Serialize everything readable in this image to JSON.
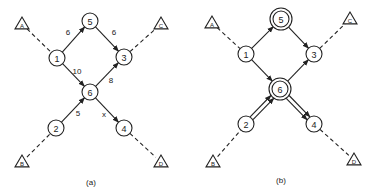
{
  "panels": [
    {
      "caption": "(a)",
      "terminals": [
        {
          "id": "A",
          "label": "A",
          "x": 22,
          "y": 24
        },
        {
          "id": "C",
          "label": "C",
          "x": 161,
          "y": 24
        },
        {
          "id": "B",
          "label": "B",
          "x": 22,
          "y": 162
        },
        {
          "id": "D",
          "label": "D",
          "x": 161,
          "y": 162
        }
      ],
      "nodes": [
        {
          "id": "1",
          "label": "1",
          "x": 57,
          "y": 58
        },
        {
          "id": "5",
          "label": "5",
          "x": 90,
          "y": 21
        },
        {
          "id": "3",
          "label": "3",
          "x": 124,
          "y": 57
        },
        {
          "id": "6",
          "label": "6",
          "x": 90,
          "y": 92
        },
        {
          "id": "2",
          "label": "2",
          "x": 56,
          "y": 128
        },
        {
          "id": "4",
          "label": "4",
          "x": 124,
          "y": 128
        }
      ],
      "edges": [
        {
          "from": "1",
          "to": "5",
          "weight": "6",
          "wx": 68,
          "wy": 32
        },
        {
          "from": "5",
          "to": "3",
          "weight": "6",
          "wx": 114,
          "wy": 32
        },
        {
          "from": "1",
          "to": "6",
          "weight": "10",
          "wx": 77,
          "wy": 71
        },
        {
          "from": "6",
          "to": "3",
          "weight": "8",
          "wx": 111,
          "wy": 80
        },
        {
          "from": "2",
          "to": "6",
          "weight": "5",
          "wx": 78,
          "wy": 113
        },
        {
          "from": "6",
          "to": "4",
          "weight": "x",
          "wx": 104,
          "wy": 114
        }
      ],
      "dashed": [
        {
          "from": "A",
          "to": "1"
        },
        {
          "from": "3",
          "to": "C"
        },
        {
          "from": "B",
          "to": "2"
        },
        {
          "from": "4",
          "to": "D"
        }
      ]
    },
    {
      "caption": "(b)",
      "terminals": [
        {
          "id": "A",
          "label": "A",
          "x": 212,
          "y": 23
        },
        {
          "id": "C",
          "label": "C",
          "x": 350,
          "y": 19
        },
        {
          "id": "B",
          "label": "B",
          "x": 213,
          "y": 162
        },
        {
          "id": "D",
          "label": "D",
          "x": 354,
          "y": 160
        }
      ],
      "nodes": [
        {
          "id": "1",
          "label": "1",
          "x": 246,
          "y": 54
        },
        {
          "id": "5",
          "label": "5",
          "x": 281,
          "y": 19,
          "double": true
        },
        {
          "id": "3",
          "label": "3",
          "x": 314,
          "y": 54
        },
        {
          "id": "6",
          "label": "6",
          "x": 280,
          "y": 89,
          "double": true
        },
        {
          "id": "2",
          "label": "2",
          "x": 246,
          "y": 124
        },
        {
          "id": "4",
          "label": "4",
          "x": 314,
          "y": 124
        }
      ],
      "edges": [
        {
          "from": "1",
          "to": "5"
        },
        {
          "from": "5",
          "to": "3"
        },
        {
          "from": "1",
          "to": "6"
        },
        {
          "from": "6",
          "to": "3"
        },
        {
          "from": "2",
          "to": "6",
          "double": true
        },
        {
          "from": "6",
          "to": "4",
          "double": true
        }
      ],
      "dashed": [
        {
          "from": "A",
          "to": "1"
        },
        {
          "from": "3",
          "to": "C"
        },
        {
          "from": "B",
          "to": "2"
        },
        {
          "from": "4",
          "to": "D"
        }
      ]
    }
  ]
}
